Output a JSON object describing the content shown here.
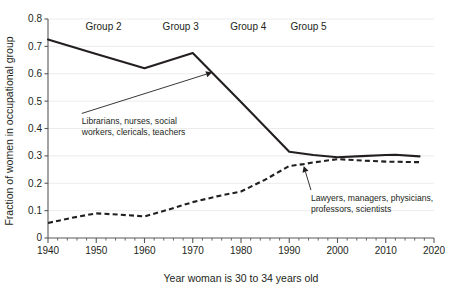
{
  "chart_data": {
    "type": "line",
    "title": "",
    "xlabel": "Year woman is 30 to 34 years old",
    "ylabel": "Fraction of women in occupational group",
    "xlim": [
      1940,
      2020
    ],
    "ylim": [
      0,
      0.8
    ],
    "grid": true,
    "legend_position": "none",
    "xticks": [
      1940,
      1950,
      1960,
      1970,
      1980,
      1990,
      2000,
      2010,
      2020
    ],
    "xtick_labels": [
      "1940",
      "1950",
      "1960",
      "1970",
      "1980",
      "1990",
      "2000",
      "2010",
      "2020"
    ],
    "xtick_minor_step": 2,
    "yticks": [
      0,
      0.1,
      0.2,
      0.3,
      0.4,
      0.5,
      0.6,
      0.7,
      0.8
    ],
    "ytick_labels": [
      "0",
      "0.1",
      "0.2",
      "0.3",
      "0.4",
      "0.5",
      "0.6",
      "0.7",
      "0.8"
    ],
    "series": [
      {
        "name": "Librarians, nurses, social workers, clericals, teachers",
        "style": "solid",
        "color": "#231f20",
        "x": [
          1940,
          1950,
          1960,
          1970,
          1980,
          1990,
          1995,
          2000,
          2005,
          2010,
          2012,
          2017
        ],
        "values": [
          0.725,
          0.672,
          0.62,
          0.676,
          0.497,
          0.315,
          0.303,
          0.295,
          0.299,
          0.303,
          0.304,
          0.298
        ]
      },
      {
        "name": "Lawyers, managers, physicians, professors, scientists",
        "style": "dashed",
        "color": "#231f20",
        "x": [
          1940,
          1945,
          1950,
          1955,
          1960,
          1965,
          1970,
          1975,
          1980,
          1985,
          1990,
          1993,
          1995,
          2000,
          2005,
          2010,
          2017
        ],
        "values": [
          0.055,
          0.074,
          0.09,
          0.085,
          0.079,
          0.104,
          0.131,
          0.152,
          0.17,
          0.213,
          0.263,
          0.27,
          0.276,
          0.288,
          0.283,
          0.279,
          0.277
        ]
      }
    ],
    "annotations": [
      {
        "id": "annotation-librarians",
        "lines": [
          "Librarians, nurses, social",
          "workers, clericals, teachers"
        ],
        "text_x": 1947.0,
        "text_y": 0.455,
        "point_x": 1974.0,
        "point_y": 0.605
      },
      {
        "id": "annotation-lawyers",
        "lines": [
          "Lawyers, managers, physicians,",
          "professors, scientists"
        ],
        "text_x": 1994.5,
        "text_y": 0.175,
        "point_x": 1993.0,
        "point_y": 0.263
      }
    ],
    "group_labels": [
      {
        "label": "Group 2",
        "x": 1951.5,
        "y": 0.772
      },
      {
        "label": "Group 3",
        "x": 1967.5,
        "y": 0.772
      },
      {
        "label": "Group 4",
        "x": 1981.5,
        "y": 0.772
      },
      {
        "label": "Group 5",
        "x": 1994.0,
        "y": 0.772
      }
    ]
  }
}
